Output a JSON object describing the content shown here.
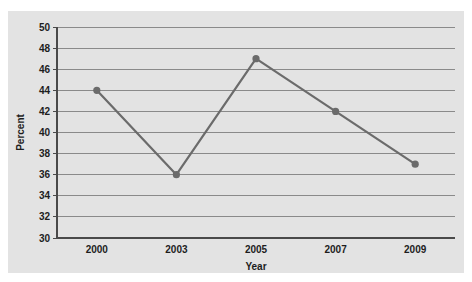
{
  "caption": {
    "text": ""
  },
  "chart_data": {
    "type": "line",
    "title": "",
    "xlabel": "Year",
    "ylabel": "Percent",
    "categories": [
      "2000",
      "2003",
      "2005",
      "2007",
      "2009"
    ],
    "x": [
      2000,
      2003,
      2005,
      2007,
      2009
    ],
    "values": [
      44,
      36,
      47,
      42,
      37
    ],
    "series": [
      {
        "name": "Percent",
        "values": [
          44,
          36,
          47,
          42,
          37
        ]
      }
    ],
    "ylim": [
      30,
      50
    ],
    "yticks": [
      30,
      32,
      34,
      36,
      38,
      40,
      42,
      44,
      46,
      48,
      50
    ],
    "ytick_labels": [
      "30",
      "32",
      "34",
      "36",
      "38",
      "40",
      "42",
      "44",
      "46",
      "48",
      "50"
    ],
    "xtick_labels": [
      "2000",
      "2003",
      "2005",
      "2007",
      "2009"
    ],
    "grid": "horizontal",
    "legend": "none",
    "colors": {
      "line": "#6b6b6b",
      "marker": "#6b6b6b",
      "grid": "#8a8a8a",
      "axis": "#4a4a4a",
      "panel_background": "#e3e3e3",
      "figure_background": "#ffffff",
      "text": "#1d1d1d"
    }
  }
}
